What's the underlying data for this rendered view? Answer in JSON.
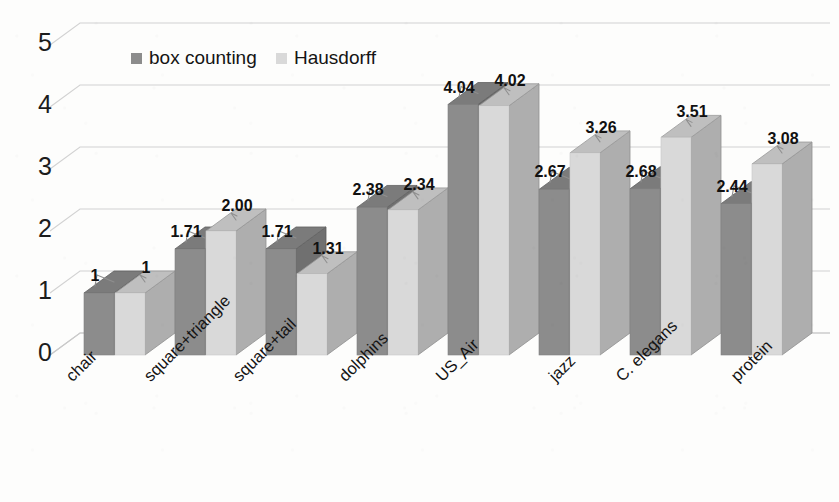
{
  "chart_data": {
    "type": "bar",
    "title": "",
    "subtitle": "",
    "xlabel": "",
    "ylabel": "",
    "ylim": [
      0,
      5
    ],
    "ytick_labels": [
      "0",
      "1",
      "2",
      "3",
      "4",
      "5"
    ],
    "grid": true,
    "three_d": true,
    "legend_position": "top-center",
    "categories": [
      "chair",
      "square+triangle",
      "square+tail",
      "dolphins",
      "US_Air",
      "jazz",
      "C. elegans",
      "protein"
    ],
    "series": [
      {
        "name": "box counting",
        "color": "#8c8c8c",
        "values": [
          1,
          1.71,
          1.71,
          2.38,
          4.04,
          2.67,
          2.68,
          2.44
        ],
        "labels": [
          "1",
          "1.71",
          "1.71",
          "2.38",
          "4.04",
          "2.67",
          "2.68",
          "2.44"
        ]
      },
      {
        "name": "Hausdorff",
        "color": "#d9d9d9",
        "values": [
          1,
          2.0,
          1.31,
          2.34,
          4.02,
          3.26,
          3.51,
          3.08
        ],
        "labels": [
          "1",
          "2.00",
          "1.31",
          "2.34",
          "4.02",
          "3.26",
          "3.51",
          "3.08"
        ]
      }
    ]
  },
  "colors": {
    "background": "#fdfdfc",
    "series_box_counting": "#8c8c8c",
    "series_hausdorff": "#d9d9d9",
    "gridline": "#d2d2d2",
    "text": "#141414"
  }
}
